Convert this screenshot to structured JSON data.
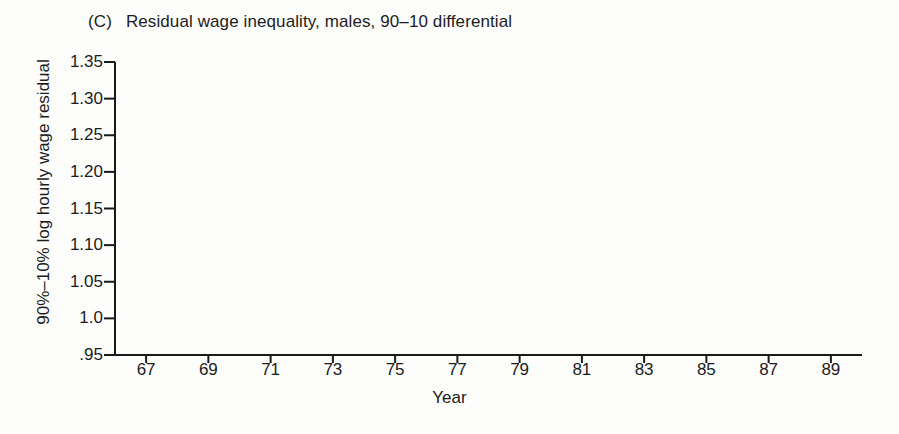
{
  "chart_data": {
    "type": "line",
    "panel_letter": "(C)",
    "title": "Residual wage inequality, males, 90–10 differential",
    "xlabel": "Year",
    "ylabel": "90%–10% log hourly wage residual",
    "grid": false,
    "legend": "none",
    "marker": "triangle-up",
    "marker_fill": "#ffffff",
    "line_color": "#1a1a1a",
    "xlim": [
      66,
      90
    ],
    "ylim": [
      0.95,
      1.35
    ],
    "ytick_labels": [
      "1.35",
      "1.30",
      "1.25",
      "1.20",
      "1.15",
      "1.10",
      "1.05",
      "1.0",
      ".95"
    ],
    "ytick_values": [
      1.35,
      1.3,
      1.25,
      1.2,
      1.15,
      1.1,
      1.05,
      1.0,
      0.95
    ],
    "xtick_labels": [
      "67",
      "69",
      "71",
      "73",
      "75",
      "77",
      "79",
      "81",
      "83",
      "85",
      "87",
      "89"
    ],
    "xtick_values": [
      67,
      69,
      71,
      73,
      75,
      77,
      79,
      81,
      83,
      85,
      87,
      89
    ],
    "x": [
      1967,
      1968,
      1969,
      1970,
      1971,
      1972,
      1973,
      1974,
      1975,
      1976,
      1977,
      1978,
      1979,
      1980,
      1981,
      1982,
      1983,
      1984,
      1985,
      1986,
      1987,
      1988,
      1989
    ],
    "values": [
      0.995,
      0.998,
      0.99,
      1.0,
      1.046,
      1.072,
      1.081,
      1.088,
      1.096,
      1.124,
      1.133,
      1.164,
      1.168,
      1.177,
      1.195,
      1.222,
      1.237,
      1.245,
      1.268,
      1.267,
      1.273,
      1.293,
      1.302
    ],
    "series": [
      {
        "name": "90–10 differential",
        "values": [
          0.995,
          0.998,
          0.99,
          1.0,
          1.046,
          1.072,
          1.081,
          1.088,
          1.096,
          1.124,
          1.133,
          1.164,
          1.168,
          1.177,
          1.195,
          1.222,
          1.237,
          1.245,
          1.268,
          1.267,
          1.273,
          1.293,
          1.302
        ]
      }
    ]
  }
}
